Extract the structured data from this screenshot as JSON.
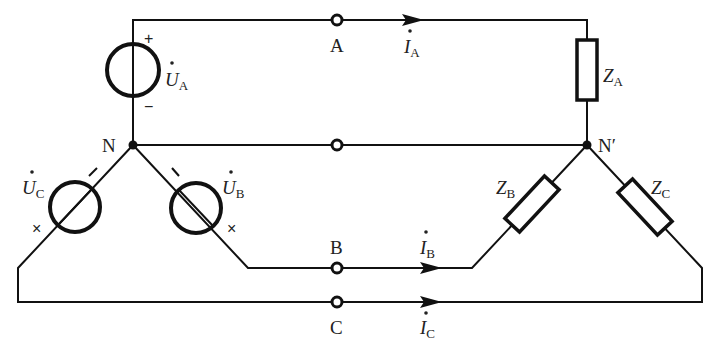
{
  "diagram": {
    "nodes": {
      "source_neutral": {
        "label": "N"
      },
      "load_neutral": {
        "label": "N′"
      }
    },
    "terminals": [
      {
        "id": "A",
        "label": "A"
      },
      {
        "id": "B",
        "label": "B"
      },
      {
        "id": "C",
        "label": "C"
      },
      {
        "id": "neutral",
        "label": ""
      }
    ],
    "sources": [
      {
        "id": "UA",
        "symbol": "U",
        "sub": "A",
        "plus_mark": "+",
        "minus_mark": "−"
      },
      {
        "id": "UB",
        "symbol": "U",
        "sub": "B",
        "minus_mark": "−",
        "cross_mark": "×"
      },
      {
        "id": "UC",
        "symbol": "U",
        "sub": "C",
        "minus_mark": "−",
        "cross_mark": "×"
      }
    ],
    "loads": [
      {
        "id": "ZA",
        "symbol": "Z",
        "sub": "A"
      },
      {
        "id": "ZB",
        "symbol": "Z",
        "sub": "B"
      },
      {
        "id": "ZC",
        "symbol": "Z",
        "sub": "C"
      }
    ],
    "currents": [
      {
        "id": "IA",
        "symbol": "I",
        "sub": "A"
      },
      {
        "id": "IB",
        "symbol": "I",
        "sub": "B"
      },
      {
        "id": "IC",
        "symbol": "I",
        "sub": "C"
      }
    ],
    "phasor_dot": "·",
    "colors": {
      "line": "#111111",
      "background": "#ffffff",
      "text": "#222222"
    }
  }
}
